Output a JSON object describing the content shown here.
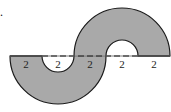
{
  "problem": {
    "number_fragment": "."
  },
  "diagram": {
    "fill_color": "#a9a9a9",
    "stroke_color": "#1a1a1a",
    "baseline_segments": [
      {
        "label": "2",
        "style": "solid"
      },
      {
        "label": "2",
        "style": "dashed"
      },
      {
        "label": "2",
        "style": "dashed"
      },
      {
        "label": "2",
        "style": "dashed"
      },
      {
        "label": "2",
        "style": "solid"
      }
    ],
    "shapes": [
      {
        "name": "lower-half-annulus",
        "outer_diameter": "2+2+2",
        "inner_diameter": "2",
        "orientation": "down"
      },
      {
        "name": "upper-half-annulus",
        "outer_diameter": "2+2+2",
        "inner_diameter": "2",
        "orientation": "up"
      }
    ]
  }
}
